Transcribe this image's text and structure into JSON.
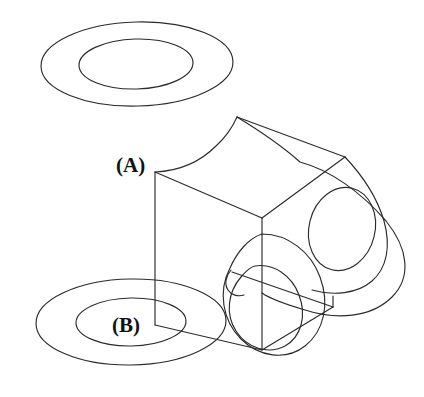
{
  "figure": {
    "background_color": "#ffffff",
    "line_color": "#2b2b2b",
    "width": 424,
    "height": 397
  },
  "labels": [
    {
      "id": "label-a",
      "text": "(A)",
      "x": 116,
      "y": 172,
      "refers_to": "upper-annulus-washer"
    },
    {
      "id": "label-b",
      "text": "(B)",
      "x": 112,
      "y": 332,
      "refers_to": "lower-annulus-washer"
    }
  ],
  "parts": [
    {
      "name": "upper-annulus",
      "description": "Washer / annular ring shown exploded above the block",
      "outer_ellipse": {
        "cx": 137,
        "cy": 64,
        "rx": 96,
        "ry": 42
      },
      "inner_ellipse": {
        "cx": 136,
        "cy": 64,
        "rx": 57,
        "ry": 25
      }
    },
    {
      "name": "lower-annulus",
      "description": "Washer / annular ring shown exploded below the block",
      "outer_ellipse": {
        "cx": 131,
        "cy": 322,
        "rx": 95,
        "ry": 43
      },
      "inner_ellipse": {
        "cx": 131,
        "cy": 322,
        "rx": 55,
        "ry": 24
      }
    },
    {
      "name": "main-block",
      "description": "Isometric cube / block body with front-left and front-right faces and a top face",
      "vertices": {
        "top_left": [
          155,
          172
        ],
        "top_front": [
          262,
          218
        ],
        "top_back_right": [
          345,
          157
        ],
        "top_back": [
          237,
          117
        ],
        "bottom_left": [
          155,
          325
        ],
        "bottom_front": [
          262,
          350
        ],
        "bottom_right": [
          345,
          303
        ]
      }
    },
    {
      "name": "right-lug",
      "description": "Rounded tab / boss on right side containing a through hole",
      "hole_ellipse": {
        "cx": 342,
        "cy": 229,
        "rx": 33,
        "ry": 42
      }
    },
    {
      "name": "center-boss-hole",
      "description": "Large cylindrical hole / counterbore through the block seen on the front-right face",
      "outer_ellipse": {
        "cx": 275,
        "cy": 292,
        "rx": 52,
        "ry": 58
      },
      "inner_ellipse": {
        "cx": 270,
        "cy": 291,
        "rx": 38,
        "ry": 43
      }
    },
    {
      "name": "leader-line",
      "description": "Vertical construction / axis line connecting label (A) to label (B)",
      "from": [
        155,
        172
      ],
      "to": [
        155,
        325
      ]
    }
  ]
}
